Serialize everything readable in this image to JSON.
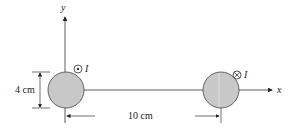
{
  "diagram": {
    "axes": {
      "x_label": "x",
      "y_label": "y"
    },
    "left_wire": {
      "current_symbol": "dot-out-of-page",
      "current_label": "I",
      "fill": "#c8c8c8"
    },
    "right_wire": {
      "current_symbol": "cross-into-page",
      "current_label": "I",
      "fill": "#c8c8c8"
    },
    "dimensions": {
      "diameter_label": "4 cm",
      "separation_label": "10 cm"
    }
  }
}
